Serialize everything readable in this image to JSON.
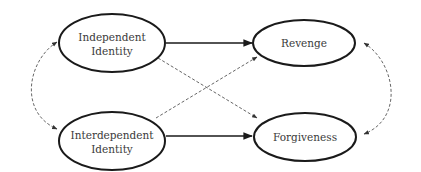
{
  "diagram": {
    "type": "path-model",
    "colors": {
      "background": "#ffffff",
      "stroke": "#1a1a1a",
      "dashed_stroke": "#555555",
      "text": "#3a3a3a"
    },
    "nodes": [
      {
        "id": "independent",
        "line1": "Independent",
        "line2": "Identity",
        "cx": 112,
        "cy": 43,
        "rx": 53,
        "ry": 29
      },
      {
        "id": "interdependent",
        "line1": "Interdependent",
        "line2": "Identity",
        "cx": 112,
        "cy": 141,
        "rx": 53,
        "ry": 29
      },
      {
        "id": "revenge",
        "line1": "Revenge",
        "line2": "",
        "cx": 304,
        "cy": 43,
        "rx": 51,
        "ry": 23
      },
      {
        "id": "forgiveness",
        "line1": "Forgiveness",
        "line2": "",
        "cx": 305,
        "cy": 137,
        "rx": 51,
        "ry": 24
      }
    ],
    "edges": [
      {
        "from": "independent",
        "to": "revenge",
        "style": "solid"
      },
      {
        "from": "interdependent",
        "to": "forgiveness",
        "style": "solid"
      },
      {
        "from": "independent",
        "to": "forgiveness",
        "style": "dashed"
      },
      {
        "from": "interdependent",
        "to": "revenge",
        "style": "dashed"
      },
      {
        "from": "independent",
        "to": "interdependent",
        "style": "dashed-curved-bidirectional"
      },
      {
        "from": "revenge",
        "to": "forgiveness",
        "style": "dashed-curved-bidirectional"
      }
    ]
  }
}
